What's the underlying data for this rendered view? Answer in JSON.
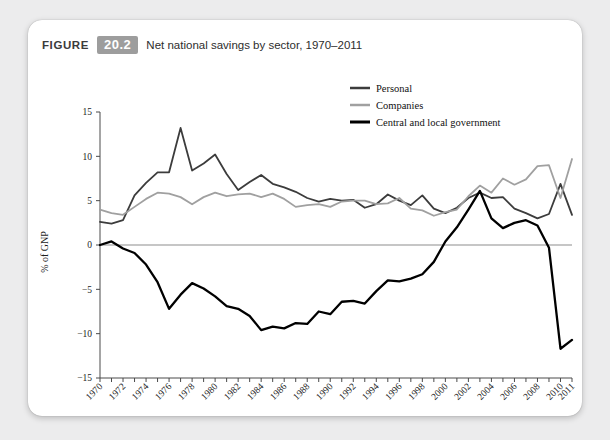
{
  "figure": {
    "label": "FIGURE",
    "number": "20.2",
    "title": "Net national savings by sector, 1970–2011"
  },
  "chart_data": {
    "type": "line",
    "title": "Net national savings by sector, 1970–2011",
    "xlabel": "",
    "ylabel": "% of GNP",
    "xlim": [
      1970,
      2011
    ],
    "ylim": [
      -15,
      15
    ],
    "yticks": [
      -15,
      -10,
      -5,
      0,
      5,
      10,
      15
    ],
    "ytick_labels": [
      "−15",
      "−10",
      "−5",
      "0",
      "5",
      "10",
      "15"
    ],
    "grid": false,
    "zero_line": true,
    "legend_position": "top-right",
    "x": [
      1970,
      1971,
      1972,
      1973,
      1974,
      1975,
      1976,
      1977,
      1978,
      1979,
      1980,
      1981,
      1982,
      1983,
      1984,
      1985,
      1986,
      1987,
      1988,
      1989,
      1990,
      1991,
      1992,
      1993,
      1994,
      1995,
      1996,
      1997,
      1998,
      1999,
      2000,
      2001,
      2002,
      2003,
      2004,
      2005,
      2006,
      2007,
      2008,
      2009,
      2010,
      2011
    ],
    "xtick_labels": [
      "1970",
      "1972",
      "1974",
      "1976",
      "1978",
      "1980",
      "1982",
      "1984",
      "1986",
      "1988",
      "1990",
      "1992",
      "1994",
      "1996",
      "1998",
      "2000",
      "2002",
      "2004",
      "2006",
      "2008",
      "2010",
      "2011"
    ],
    "series": [
      {
        "name": "Personal",
        "color": "#3c3c3c",
        "width": 1.8,
        "values": [
          2.6,
          2.4,
          2.8,
          5.6,
          7.0,
          8.2,
          8.2,
          13.2,
          8.4,
          9.2,
          10.2,
          8.0,
          6.2,
          7.1,
          7.9,
          6.9,
          6.5,
          6.0,
          5.3,
          4.9,
          5.2,
          5.0,
          5.1,
          4.2,
          4.6,
          5.7,
          5.0,
          4.5,
          5.6,
          4.1,
          3.6,
          4.2,
          5.3,
          5.9,
          5.3,
          5.4,
          4.1,
          3.6,
          3.0,
          3.5,
          6.9,
          3.4
        ]
      },
      {
        "name": "Companies",
        "color": "#a0a0a0",
        "width": 1.8,
        "values": [
          4.0,
          3.6,
          3.4,
          4.3,
          5.2,
          5.9,
          5.8,
          5.4,
          4.6,
          5.4,
          5.9,
          5.5,
          5.7,
          5.8,
          5.4,
          5.8,
          5.2,
          4.3,
          4.5,
          4.6,
          4.3,
          4.9,
          5.0,
          5.0,
          4.6,
          4.7,
          5.3,
          4.1,
          3.9,
          3.3,
          3.7,
          4.0,
          5.5,
          6.7,
          5.9,
          7.5,
          6.8,
          7.4,
          8.9,
          9.0,
          5.3,
          9.7
        ]
      },
      {
        "name": "Central and local government",
        "color": "#000000",
        "width": 2.3,
        "values": [
          0.0,
          0.4,
          -0.4,
          -0.9,
          -2.2,
          -4.2,
          -7.2,
          -5.6,
          -4.3,
          -4.9,
          -5.8,
          -6.9,
          -7.2,
          -8.0,
          -9.6,
          -9.2,
          -9.4,
          -8.8,
          -8.9,
          -7.5,
          -7.8,
          -6.4,
          -6.3,
          -6.6,
          -5.2,
          -4.0,
          -4.1,
          -3.8,
          -3.3,
          -1.9,
          0.4,
          2.0,
          4.0,
          6.1,
          3.0,
          1.9,
          2.5,
          2.8,
          2.2,
          -0.3,
          -11.7,
          -10.7
        ]
      }
    ]
  }
}
